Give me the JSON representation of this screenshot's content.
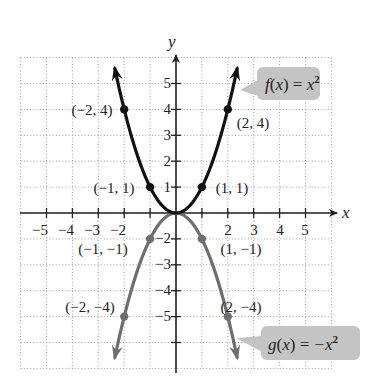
{
  "figure": {
    "x_axis_label": "x",
    "y_axis_label": "y",
    "x_ticks": [
      "-5",
      "-4",
      "-3",
      "-2",
      "2",
      "3",
      "4",
      "5"
    ],
    "x_tick_labels": [
      "−5",
      "−4",
      "−3",
      "−2",
      "2",
      "3",
      "4",
      "5"
    ],
    "y_ticks_pos": [
      "5",
      "4",
      "3",
      "2",
      "1"
    ],
    "y_ticks_neg": [
      "−2",
      "−3",
      "−4",
      "−5"
    ],
    "grid": {
      "xmin": -6,
      "xmax": 6,
      "ymin": -6,
      "ymax": 6,
      "style": "dotted"
    },
    "f": {
      "name": "f(x) = x²",
      "label_func": "f",
      "label_var": "x",
      "label_rhs": "x",
      "label_exp": "2",
      "color": "#111111",
      "points": [
        {
          "label": "(−2, 4)",
          "x": -2,
          "y": 4
        },
        {
          "label": "(−1, 1)",
          "x": -1,
          "y": 1
        },
        {
          "label": "(1, 1)",
          "x": 1,
          "y": 1
        },
        {
          "label": "(2, 4)",
          "x": 2,
          "y": 4
        }
      ]
    },
    "g": {
      "name": "g(x) = −x²",
      "label_func": "g",
      "label_var": "x",
      "label_rhs": "−x",
      "label_exp": "2",
      "color": "#6e6e6e",
      "points": [
        {
          "label": "(−1, −1)",
          "x": -1,
          "y": -1
        },
        {
          "label": "(1, −1)",
          "x": 1,
          "y": -1
        },
        {
          "label": "(−2, −4)",
          "x": -2,
          "y": -4
        },
        {
          "label": "(2, −4)",
          "x": 2,
          "y": -4
        }
      ]
    },
    "callout_fill": "#c4c4c4"
  }
}
